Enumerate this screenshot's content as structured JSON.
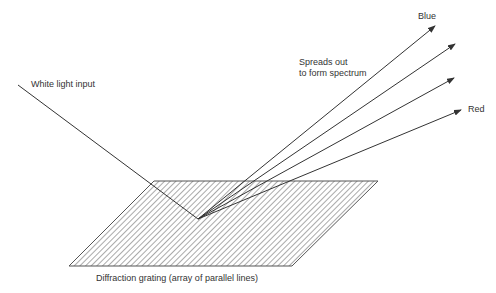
{
  "diagram": {
    "labels": {
      "input": "White light input",
      "spread_line1": "Spreads out",
      "spread_line2": "to form spectrum",
      "blue": "Blue",
      "red": "Red",
      "grating": "Diffraction grating (array of parallel lines)"
    },
    "colors": {
      "line": "#333333",
      "hatch": "#555555",
      "background": "#ffffff"
    },
    "grating": {
      "top_left": [
        154,
        181
      ],
      "top_right": [
        378,
        181
      ],
      "bottom_right": [
        292,
        266
      ],
      "bottom_left": [
        69,
        266
      ]
    },
    "incidence_point": [
      198,
      219
    ],
    "input_ray_start": [
      18,
      85
    ],
    "output_rays": [
      {
        "name": "blue",
        "tip": [
          435,
          26
        ]
      },
      {
        "name": "ray-2",
        "tip": [
          455,
          44
        ]
      },
      {
        "name": "ray-3",
        "tip": [
          454,
          78
        ]
      },
      {
        "name": "red",
        "tip": [
          461,
          110
        ]
      }
    ]
  }
}
